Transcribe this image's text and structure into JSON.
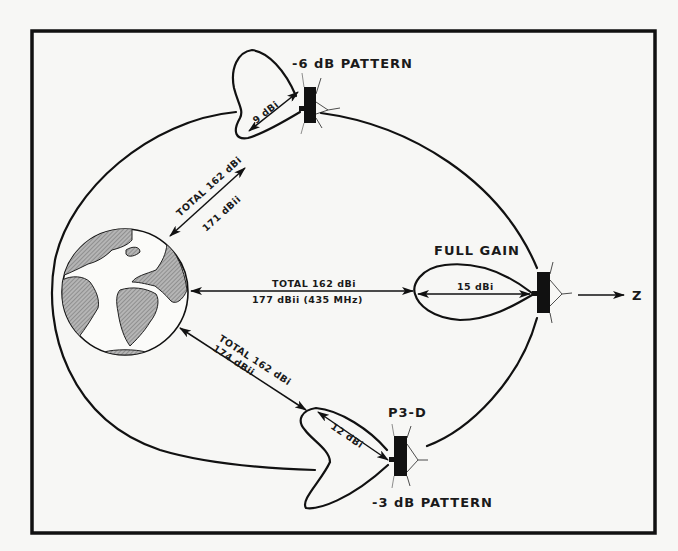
{
  "diagram": {
    "type": "orbital link-budget diagram",
    "central_body": "Earth",
    "spacecraft_name": "P3-D",
    "direction_axis_label": "Z",
    "colors": {
      "ink": "#111111",
      "paper": "#f7f7f5",
      "land_hatch": "#8a8a8a"
    },
    "positions": [
      {
        "id": "top",
        "pattern_label": "-6 dB PATTERN",
        "antenna_gain": "9 dBi",
        "link_total": "TOTAL 162 dBi",
        "link_isotropic": "171 dBii"
      },
      {
        "id": "apogee",
        "pattern_label": "FULL GAIN",
        "antenna_gain": "15 dBi",
        "link_total": "TOTAL 162 dBi",
        "link_isotropic": "177 dBii (435 MHz)"
      },
      {
        "id": "bottom",
        "pattern_label": "-3 dB PATTERN",
        "antenna_gain": "12 dBi",
        "link_total": "TOTAL 162 dBi",
        "link_isotropic": "174 dBii"
      }
    ]
  }
}
